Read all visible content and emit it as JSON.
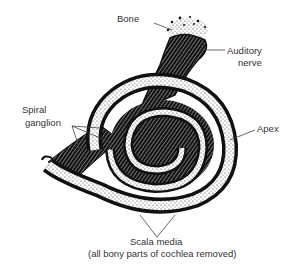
{
  "figure": {
    "labels": {
      "bone": "Bone",
      "auditory_nerve_line1": "Auditory",
      "auditory_nerve_line2": "nerve",
      "spiral_ganglion_line1": "Spiral",
      "spiral_ganglion_line2": "ganglion",
      "apex": "Apex",
      "scala_media": "Scala media",
      "caption": "(all bony parts of cochlea removed)"
    },
    "colors": {
      "ink": "#111111",
      "background": "#ffffff",
      "leader_line": "#444444"
    }
  }
}
